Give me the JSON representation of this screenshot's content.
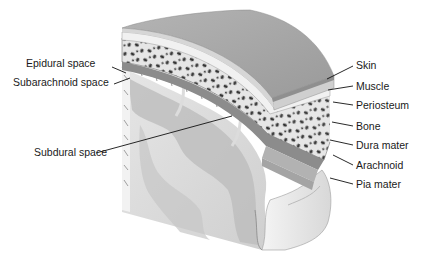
{
  "diagram": {
    "colors": {
      "background": "#ffffff",
      "skin": "#a9a9a9",
      "muscle": "#cfcfcf",
      "periosteum": "#ececec",
      "bone": "#e4e4e4",
      "bone_spots": "#3a3a3a",
      "dura": "#8a8a8a",
      "arachnoid": "#b5b5b5",
      "pia_brain": "#ebebeb",
      "brain_cut": "#d9d9d9",
      "brain_dark": "#b0b0b0",
      "label_text": "#1a1a1a",
      "leader_line": "#111111"
    },
    "labels_left": [
      {
        "id": "epidural",
        "text": "Epidural space"
      },
      {
        "id": "subarachnoid",
        "text": "Subarachnoid space"
      },
      {
        "id": "subdural",
        "text": "Subdural space"
      }
    ],
    "labels_right": [
      {
        "id": "skin",
        "text": "Skin"
      },
      {
        "id": "muscle",
        "text": "Muscle"
      },
      {
        "id": "periosteum",
        "text": "Periosteum"
      },
      {
        "id": "bone",
        "text": "Bone"
      },
      {
        "id": "dura",
        "text": "Dura mater"
      },
      {
        "id": "arachnoid",
        "text": "Arachnoid"
      },
      {
        "id": "pia",
        "text": "Pia mater"
      }
    ]
  }
}
